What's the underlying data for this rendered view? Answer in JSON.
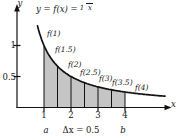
{
  "figure": {
    "equation": {
      "lhs": "y = f(x) =",
      "numerator": "1",
      "denominator": "x"
    },
    "axis_labels": {
      "x": "x",
      "y": "y"
    },
    "y_tick_labels": [
      "1",
      "0.5"
    ],
    "x_tick_labels": [
      "1",
      "2",
      "3",
      "4"
    ],
    "curve_labels": [
      "f(1)",
      "f(1.5)",
      "f(2)",
      "f(2.5)",
      "f(3)",
      "f(3.5)",
      "f(4)"
    ],
    "bottom_labels": {
      "a": "a",
      "delta_x": "Δx = 0.5",
      "b": "b"
    }
  },
  "chart_data": {
    "type": "line",
    "function": "f(x) = 1/x",
    "xlabel": "x",
    "ylabel": "y",
    "xlim": [
      0,
      5.7
    ],
    "ylim": [
      0,
      1.65
    ],
    "x_ticks": [
      1,
      2,
      3,
      4
    ],
    "y_ticks": [
      0.5,
      1
    ],
    "interval": {
      "a": 1,
      "b": 4
    },
    "delta_x": 0.5,
    "sample_points": {
      "x": [
        1,
        1.5,
        2,
        2.5,
        3,
        3.5,
        4
      ],
      "y": [
        1,
        0.6667,
        0.5,
        0.4,
        0.3333,
        0.2857,
        0.25
      ]
    },
    "shaded_region": "area under y=1/x from x=1 to x=4, subdivided into 6 strips of width 0.5",
    "annotations": [
      "f(1)",
      "f(1.5)",
      "f(2)",
      "f(2.5)",
      "f(3)",
      "f(3.5)",
      "f(4)",
      "a",
      "Δx = 0.5",
      "b"
    ],
    "grid": false,
    "legend": false,
    "fill_color": "#c5c5c5",
    "line_color": "#111111"
  }
}
